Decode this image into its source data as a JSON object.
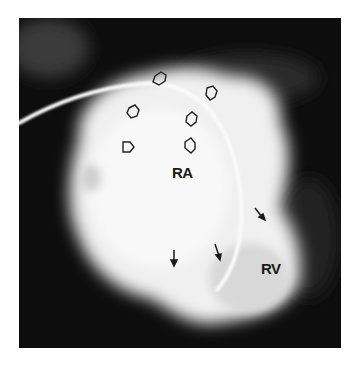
{
  "figure": {
    "type": "angiogram",
    "labels": {
      "ra": "RA",
      "rv": "RV"
    },
    "annotations": {
      "open_arrows": 6,
      "solid_arrows": 3
    },
    "colors": {
      "background": "#0d0d0d",
      "contrast": "#f2f2f2",
      "page": "#ffffff"
    }
  }
}
